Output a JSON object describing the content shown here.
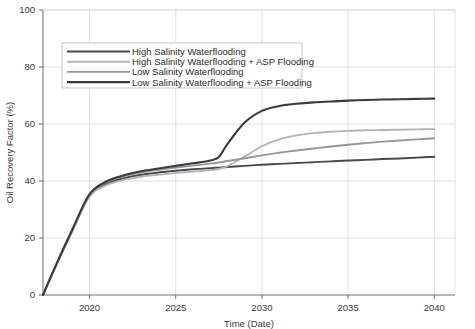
{
  "chart_data": {
    "type": "line",
    "title": "",
    "xlabel": "Time (Date)",
    "ylabel": "Oil Recovery Factor (%)",
    "xlim": [
      2017.3,
      2041.2
    ],
    "ylim": [
      0,
      100
    ],
    "xticks": [
      "2020",
      "2025",
      "2030",
      "2035",
      "2040"
    ],
    "xtick_values": [
      2020,
      2025,
      2030,
      2035,
      2040
    ],
    "yticks": [
      "0",
      "20",
      "40",
      "60",
      "80",
      "100"
    ],
    "ytick_values": [
      0,
      20,
      40,
      60,
      80,
      100
    ],
    "grid": true,
    "legend_position": "upper-left-inside",
    "x": [
      2017.3,
      2018.0,
      2019.0,
      2020.0,
      2021.0,
      2022.0,
      2023.0,
      2024.0,
      2025.0,
      2026.0,
      2027.0,
      2027.5,
      2028.0,
      2029.0,
      2030.0,
      2031.0,
      2032.0,
      2033.0,
      2034.0,
      2035.0,
      2036.0,
      2037.0,
      2038.0,
      2039.0,
      2040.0
    ],
    "series": [
      {
        "name": "High Salinity Waterflooding",
        "color": "#4a4a4e",
        "width": 1.9,
        "values": [
          0,
          9.6,
          22.5,
          34.8,
          39.0,
          41.0,
          42.2,
          43.0,
          43.6,
          44.1,
          44.5,
          44.7,
          44.9,
          45.3,
          45.7,
          46.0,
          46.3,
          46.6,
          46.9,
          47.2,
          47.4,
          47.7,
          47.9,
          48.2,
          48.5
        ]
      },
      {
        "name": "High Salinity Waterflooding + ASP Flooding",
        "color": "#b4b4b8",
        "width": 1.9,
        "values": [
          0,
          9.6,
          22.5,
          34.6,
          38.6,
          40.4,
          41.5,
          42.2,
          42.8,
          43.3,
          43.8,
          44.2,
          45.2,
          48.6,
          52.2,
          54.6,
          56.0,
          56.8,
          57.3,
          57.6,
          57.8,
          57.9,
          58.0,
          58.1,
          58.2
        ]
      },
      {
        "name": "Low Salinity Waterflooding",
        "color": "#97979b",
        "width": 1.9,
        "values": [
          0,
          9.7,
          22.8,
          35.2,
          39.6,
          41.7,
          43.0,
          43.9,
          44.7,
          45.4,
          46.1,
          46.5,
          47.0,
          48.0,
          49.0,
          49.9,
          50.7,
          51.4,
          52.1,
          52.7,
          53.3,
          53.8,
          54.2,
          54.6,
          55.0
        ]
      },
      {
        "name": "Low Salinity Waterflooding + ASP Flooding",
        "color": "#3b3b3f",
        "width": 2.1,
        "values": [
          0,
          9.8,
          23.0,
          35.4,
          39.9,
          42.0,
          43.4,
          44.4,
          45.3,
          46.2,
          47.2,
          48.4,
          53.0,
          60.5,
          64.6,
          66.3,
          67.1,
          67.6,
          67.9,
          68.2,
          68.4,
          68.6,
          68.7,
          68.8,
          68.9
        ]
      }
    ]
  },
  "legend": {
    "entries": [
      "High Salinity Waterflooding",
      "High Salinity Waterflooding + ASP Flooding",
      "Low Salinity Waterflooding",
      "Low Salinity Waterflooding + ASP Flooding"
    ]
  },
  "colors": {
    "axis": "#6e6e72",
    "grid": "#d8d8dc",
    "text": "#3a3a3a",
    "background": "#ffffff"
  }
}
